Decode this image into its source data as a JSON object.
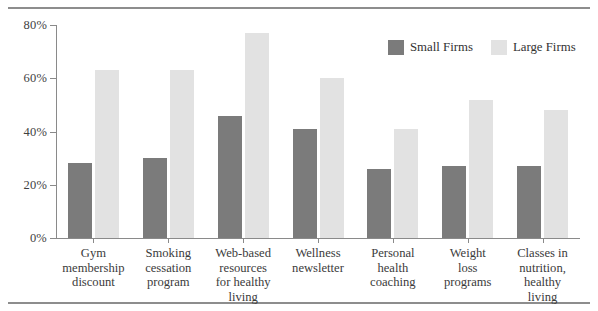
{
  "chart_data": {
    "type": "bar",
    "title": "",
    "subtitle": "",
    "xlabel": "",
    "ylabel": "",
    "ylim": [
      0,
      80
    ],
    "y_ticks": [
      0,
      20,
      40,
      60,
      80
    ],
    "y_tick_labels": [
      "0%",
      "20%",
      "40%",
      "60%",
      "80%"
    ],
    "grid": false,
    "legend_position": "top-right",
    "categories": [
      "Gym membership discount",
      "Smoking cessation program",
      "Web-based resources for healthy living",
      "Wellness newsletter",
      "Personal health coaching",
      "Weight loss programs",
      "Classes in nutrition, healthy living"
    ],
    "category_lines": [
      [
        "Gym",
        "membership",
        "discount"
      ],
      [
        "Smoking",
        "cessation",
        "program"
      ],
      [
        "Web-based",
        "resources",
        "for healthy",
        "living"
      ],
      [
        "Wellness",
        "newsletter"
      ],
      [
        "Personal",
        "health",
        "coaching"
      ],
      [
        "Weight",
        "loss",
        "programs"
      ],
      [
        "Classes in",
        "nutrition,",
        "healthy",
        "living"
      ]
    ],
    "series": [
      {
        "name": "Small Firms",
        "color": "#7b7b7b",
        "values": [
          28,
          30,
          46,
          41,
          26,
          27,
          27
        ]
      },
      {
        "name": "Large Firms",
        "color": "#e2e2e2",
        "values": [
          63,
          63,
          77,
          60,
          41,
          52,
          48
        ]
      }
    ]
  },
  "legend": {
    "items": [
      {
        "label": "Small Firms",
        "color": "#7b7b7b"
      },
      {
        "label": "Large Firms",
        "color": "#e2e2e2"
      }
    ]
  },
  "colors": {
    "small_firms": "#7b7b7b",
    "large_firms": "#e2e2e2",
    "axis": "#8a8a8a",
    "rule": "#8d8d8d",
    "text": "#3b3b3b",
    "background": "#ffffff"
  }
}
